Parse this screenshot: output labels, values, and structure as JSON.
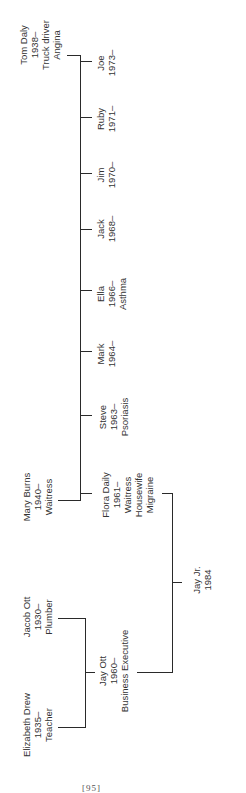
{
  "diagram": {
    "type": "genogram",
    "orientation": "rotated-90-ccw",
    "people": {
      "tom_daly": {
        "name": "Tom Daly",
        "born": "1938–",
        "lines": [
          "Tom Daly",
          "1938–",
          "Truck driver",
          "Angina"
        ]
      },
      "mary_burns": {
        "name": "Mary Burns",
        "born": "1940–",
        "lines": [
          "Mary Burns",
          "1940–",
          "Waitress"
        ]
      },
      "joe": {
        "name": "Joe",
        "lines": [
          "Joe",
          "1973–"
        ]
      },
      "ruby": {
        "name": "Ruby",
        "lines": [
          "Ruby",
          "1971–"
        ]
      },
      "jim": {
        "name": "Jim",
        "lines": [
          "Jim",
          "1970–"
        ]
      },
      "jack": {
        "name": "Jack",
        "lines": [
          "Jack",
          "1968–"
        ]
      },
      "ella": {
        "name": "Ella",
        "lines": [
          "Ella",
          "1966–",
          "Asthma"
        ]
      },
      "mark": {
        "name": "Mark",
        "lines": [
          "Mark",
          "1964–"
        ]
      },
      "steve": {
        "name": "Steve",
        "lines": [
          "Steve",
          "1963–",
          "Psoriasis"
        ]
      },
      "flora_daily": {
        "name": "Flora Daily",
        "lines": [
          "Flora Daily",
          "1961–",
          "Waitress",
          "Housewife",
          "Migraine"
        ]
      },
      "jay_jr": {
        "name": "Jay Jr.",
        "lines": [
          "Jay Jr.",
          "1984"
        ]
      },
      "jacob_ott": {
        "name": "Jacob Ott",
        "lines": [
          "Jacob Ott",
          "1930–",
          "Plumber"
        ]
      },
      "elizabeth_drew": {
        "name": "Elizabeth Drew",
        "lines": [
          "Elizabeth Drew",
          "1935–",
          "Teacher"
        ]
      },
      "jay_ott": {
        "name": "Jay Ott",
        "lines": [
          "Jay Ott",
          "1960–",
          "Business Executive"
        ]
      }
    },
    "relationships": [
      {
        "parents": [
          "Tom Daly",
          "Mary Burns"
        ],
        "children": [
          "Joe",
          "Ruby",
          "Jim",
          "Jack",
          "Ella",
          "Mark",
          "Steve",
          "Flora Daily"
        ]
      },
      {
        "parents": [
          "Jacob Ott",
          "Elizabeth Drew"
        ],
        "children": [
          "Jay Ott"
        ]
      },
      {
        "parents": [
          "Flora Daily",
          "Jay Ott"
        ],
        "children": [
          "Jay Jr."
        ]
      }
    ]
  },
  "footer": {
    "page_number": "[95]"
  }
}
